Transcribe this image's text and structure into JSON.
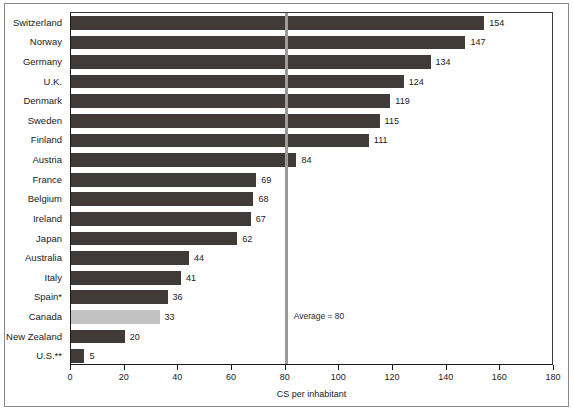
{
  "chart_data": {
    "type": "bar",
    "orientation": "horizontal",
    "title": "",
    "xlabel": "CS per inhabitant",
    "ylabel": "",
    "xlim": [
      0,
      180
    ],
    "ylim": null,
    "grid": false,
    "legend": null,
    "xticks": [
      0,
      20,
      40,
      60,
      80,
      100,
      120,
      140,
      160,
      180
    ],
    "xticklabels": [
      "0",
      "20",
      "40",
      "60",
      "80",
      "100",
      "120",
      "140",
      "160",
      "180"
    ],
    "categories": [
      "Switzerland",
      "Norway",
      "Germany",
      "U.K.",
      "Denmark",
      "Sweden",
      "Finland",
      "Austria",
      "France",
      "Belgium",
      "Ireland",
      "Japan",
      "Australia",
      "Italy",
      "Spain*",
      "Canada",
      "New Zealand",
      "U.S.**"
    ],
    "values": [
      154,
      147,
      134,
      124,
      119,
      115,
      111,
      84,
      69,
      68,
      67,
      62,
      44,
      41,
      36,
      33,
      20,
      5
    ],
    "value_labels": [
      "154",
      "147",
      "134",
      "124",
      "119",
      "115",
      "111",
      "84",
      "69",
      "68",
      "67",
      "62",
      "44",
      "41",
      "36",
      "33",
      "20",
      "5"
    ],
    "highlight_category": "Canada",
    "annotations": [
      {
        "text": "Average = 80",
        "x": 80,
        "note": "vertical reference line at x = 80"
      }
    ],
    "colors": {
      "bar": "#403a38",
      "bar_highlight": "#c2c2c2",
      "average_line": "#9b9b9b",
      "axis": "#1a1a1a",
      "text": "#1a1a1a",
      "background": "#ffffff",
      "frame": "#8a8a8a"
    }
  }
}
